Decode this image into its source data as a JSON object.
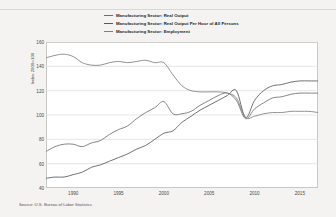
{
  "figure": {
    "source_note": "Source: U.S. Bureau of Labor Statistics",
    "y_axis_title": "Index 2009=100"
  },
  "legend": {
    "items": [
      {
        "label": "Manufacturing Sector: Real Output",
        "color": "#6b6f73"
      },
      {
        "label": "Manufacturing Sector: Real Output Per Hour of All Persons",
        "color": "#55585c"
      },
      {
        "label": "Manufacturing Sector: Employment",
        "color": "#7b7f83"
      }
    ]
  },
  "chart_data": {
    "type": "line",
    "title": "",
    "subtitle": "",
    "xlabel": "",
    "ylabel": "Index 2009=100",
    "xlim": [
      1987,
      2017
    ],
    "ylim": [
      40,
      160
    ],
    "yticks": [
      160,
      140,
      120,
      100,
      80,
      60,
      40
    ],
    "xticks": [
      1990,
      1995,
      2000,
      2005,
      2010,
      2015
    ],
    "grid": true,
    "grid_axis": "y",
    "legend_position": "top",
    "annotations": [
      "Source: U.S. Bureau of Labor Statistics"
    ],
    "x": [
      1987,
      1988,
      1989,
      1990,
      1991,
      1992,
      1993,
      1994,
      1995,
      1996,
      1997,
      1998,
      1999,
      2000,
      2001,
      2002,
      2003,
      2004,
      2005,
      2006,
      2007,
      2008,
      2009,
      2010,
      2011,
      2012,
      2013,
      2014,
      2015,
      2016,
      2017
    ],
    "series": [
      {
        "name": "Manufacturing Sector: Real Output",
        "color": "#6b6f73",
        "values": [
          70,
          74,
          76,
          76,
          74,
          77,
          79,
          84,
          88,
          91,
          97,
          102,
          106,
          111,
          101,
          101,
          103,
          108,
          112,
          116,
          118,
          112,
          97,
          105,
          110,
          114,
          115,
          117,
          118,
          118,
          118
        ]
      },
      {
        "name": "Manufacturing Sector: Real Output Per Hour of All Persons",
        "color": "#55585c",
        "values": [
          48,
          49,
          49,
          51,
          53,
          57,
          59,
          62,
          65,
          68,
          72,
          75,
          80,
          85,
          87,
          94,
          99,
          104,
          108,
          112,
          116,
          120,
          98,
          112,
          120,
          124,
          125,
          127,
          128,
          128,
          128
        ]
      },
      {
        "name": "Manufacturing Sector: Employment",
        "color": "#7b7f83",
        "values": [
          147,
          149,
          150,
          148,
          143,
          141,
          141,
          143,
          144,
          143,
          144,
          145,
          143,
          143,
          133,
          124,
          120,
          119,
          119,
          119,
          118,
          114,
          98,
          99,
          101,
          102,
          102,
          103,
          103,
          103,
          102
        ]
      }
    ]
  }
}
